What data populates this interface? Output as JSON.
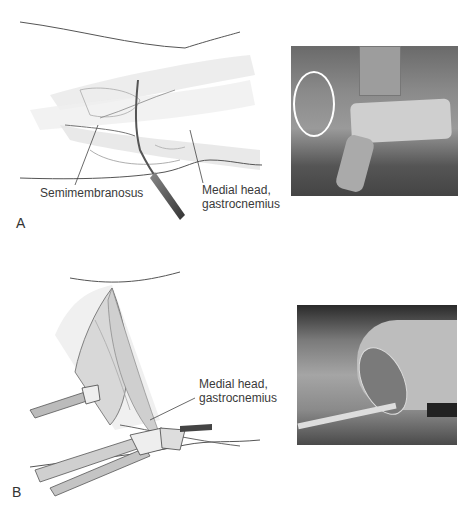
{
  "figure": {
    "panels": [
      {
        "letter": "A",
        "illustration": {
          "labels": {
            "semimembranosus": "Semimembranosus",
            "medial_head_line1": "Medial head,",
            "medial_head_line2": "gastrocnemius"
          }
        },
        "photo": {
          "description": "intraoperative photo, patient positioning with knee marked"
        }
      },
      {
        "letter": "B",
        "illustration": {
          "labels": {
            "medial_head_line1": "Medial head,",
            "medial_head_line2": "gastrocnemius"
          }
        },
        "photo": {
          "description": "intraoperative photo, posteromedial incision with retractor"
        }
      }
    ]
  }
}
